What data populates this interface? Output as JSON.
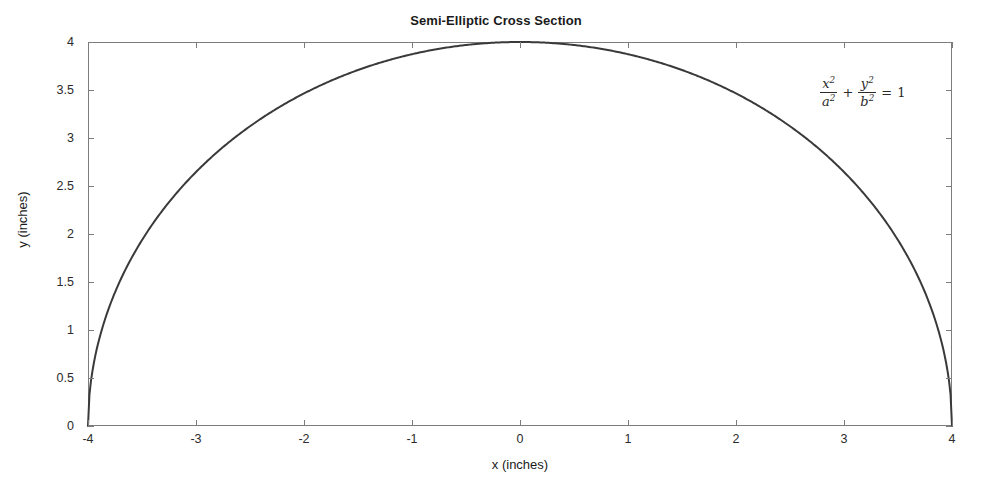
{
  "chart_data": {
    "type": "line",
    "title": "Semi-Elliptic Cross Section",
    "xlabel": "x (inches)",
    "ylabel": "y (inches)",
    "xlim": [
      -4,
      4
    ],
    "ylim": [
      0,
      4
    ],
    "xticks": [
      "-4",
      "-3",
      "-2",
      "-1",
      "0",
      "1",
      "2",
      "3",
      "4"
    ],
    "xtick_values": [
      -4,
      -3,
      -2,
      -1,
      0,
      1,
      2,
      3,
      4
    ],
    "yticks": [
      "0",
      "0.5",
      "1",
      "1.5",
      "2",
      "2.5",
      "3",
      "3.5",
      "4"
    ],
    "ytick_values": [
      0,
      0.5,
      1,
      1.5,
      2,
      2.5,
      3,
      3.5,
      4
    ],
    "grid": false,
    "legend": null,
    "series": [
      {
        "name": "semi-ellipse",
        "color": "#3a3a3a",
        "linewidth": 2,
        "description": "Upper half of ellipse with semi-major axis a = 4 inches and semi-minor axis b = 4 inches, y = b*sqrt(1 - x^2/a^2)",
        "a": 4,
        "b": 4,
        "x": [
          -4,
          -3.8,
          -3.6,
          -3.4,
          -3.2,
          -3,
          -2.8,
          -2.6,
          -2.4,
          -2.2,
          -2,
          -1.8,
          -1.6,
          -1.4,
          -1.2,
          -1,
          -0.8,
          -0.6,
          -0.4,
          -0.2,
          0,
          0.2,
          0.4,
          0.6,
          0.8,
          1,
          1.2,
          1.4,
          1.6,
          1.8,
          2,
          2.2,
          2.4,
          2.6,
          2.8,
          3,
          3.2,
          3.4,
          3.6,
          3.8,
          4
        ],
        "y": [
          0,
          1.249,
          1.744,
          2.098,
          2.4,
          2.646,
          2.857,
          3.038,
          3.199,
          3.341,
          3.464,
          3.572,
          3.666,
          3.747,
          3.815,
          3.873,
          3.919,
          3.955,
          3.98,
          3.995,
          4,
          3.995,
          3.98,
          3.955,
          3.919,
          3.873,
          3.815,
          3.747,
          3.666,
          3.572,
          3.464,
          3.341,
          3.199,
          3.038,
          2.857,
          2.646,
          2.4,
          2.098,
          1.744,
          1.249,
          0
        ]
      }
    ],
    "annotations": [
      {
        "name": "ellipse-equation",
        "text": "x^2/a^2 + y^2/b^2 = 1",
        "x": 3.4,
        "y": 3.65,
        "parts": {
          "num1": "x",
          "den1": "a",
          "num2": "y",
          "den2": "b",
          "exponent": "2",
          "plus": "+",
          "equals": "=",
          "one": "1"
        }
      }
    ]
  },
  "figure": {
    "background": "#ffffff",
    "axis_color": "#7c7c7c",
    "text_color": "#1a1a1a",
    "curve_color": "#3a3a3a"
  }
}
